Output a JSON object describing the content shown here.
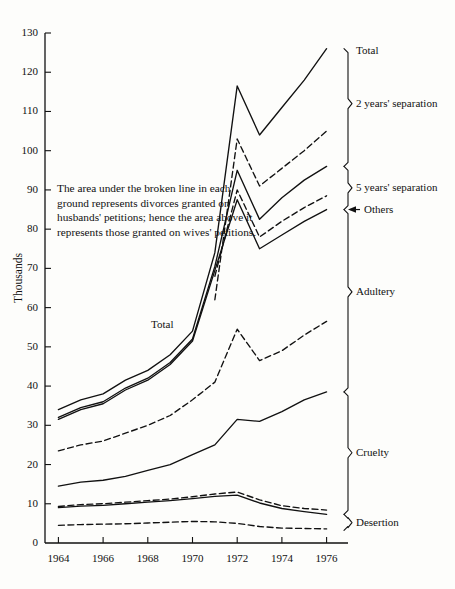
{
  "figure": {
    "y_axis_title": "Thousands",
    "annotation": "The area under the broken line in each ground represents divorces granted on husbands' petitions; hence the area above it represents those granted on wives' petitions.",
    "inner_total_label": "Total"
  },
  "chart_data": {
    "type": "area",
    "title": "",
    "xlabel": "",
    "ylabel": "Thousands",
    "xlim": [
      1963.4,
      1976.6
    ],
    "ylim": [
      0,
      130
    ],
    "yticks": [
      0,
      10,
      20,
      30,
      40,
      50,
      60,
      70,
      80,
      90,
      100,
      110,
      120,
      130
    ],
    "xticks": [
      1964,
      1966,
      1968,
      1970,
      1972,
      1974,
      1976
    ],
    "xtick_labels": [
      "1964",
      "1966",
      "1968",
      "1970",
      "1972",
      "1974",
      "1976"
    ],
    "grid": false,
    "legend_position": "right-brackets",
    "x": [
      1964,
      1965,
      1966,
      1967,
      1968,
      1969,
      1970,
      1971,
      1972,
      1973,
      1974,
      1975,
      1976
    ],
    "series": [
      {
        "name": "Total (all grounds, cumulative top)",
        "style": "solid",
        "bracket": "Total",
        "values": [
          34.0,
          36.5,
          38.0,
          41.5,
          44.0,
          48.0,
          54.0,
          74.0,
          116.5,
          104.0,
          111.0,
          118.0,
          126.0
        ]
      },
      {
        "name": "2 years' separation (husbands' petitions, broken)",
        "style": "dashed",
        "bracket": "2 years' separation",
        "values": [
          null,
          null,
          null,
          null,
          null,
          null,
          null,
          62.0,
          103.0,
          91.0,
          95.5,
          100.0,
          105.0
        ]
      },
      {
        "name": "2 years' separation lower bound",
        "style": "solid",
        "bracket": "",
        "values": [
          32.0,
          34.5,
          36.0,
          39.5,
          42.0,
          46.0,
          52.0,
          70.5,
          95.0,
          82.5,
          88.0,
          92.5,
          96.0
        ]
      },
      {
        "name": "5 years' separation (husbands' petitions, broken)",
        "style": "dashed",
        "bracket": "5 years' separation",
        "values": [
          null,
          null,
          null,
          null,
          null,
          null,
          null,
          68.0,
          90.0,
          78.0,
          82.0,
          85.5,
          88.5
        ]
      },
      {
        "name": "Others",
        "style": "solid",
        "bracket": "Others",
        "values": [
          31.5,
          34.0,
          35.5,
          39.0,
          41.5,
          45.5,
          51.5,
          69.5,
          87.5,
          75.0,
          78.5,
          82.0,
          85.0
        ]
      },
      {
        "name": "Adultery (broken, husbands' petitions)",
        "style": "dashed",
        "bracket": "Adultery",
        "values": [
          23.5,
          25.0,
          26.0,
          28.0,
          30.0,
          32.5,
          36.5,
          41.0,
          54.5,
          46.5,
          49.0,
          53.0,
          56.5
        ]
      },
      {
        "name": "Adultery lower bound",
        "style": "solid",
        "bracket": "",
        "values": [
          14.5,
          15.5,
          16.0,
          17.0,
          18.5,
          20.0,
          22.5,
          25.0,
          31.5,
          31.0,
          33.5,
          36.5,
          38.5
        ]
      },
      {
        "name": "Cruelty (broken, husbands' petitions)",
        "style": "dashed",
        "bracket": "Cruelty",
        "values": [
          9.3,
          9.8,
          10.0,
          10.4,
          10.8,
          11.2,
          11.8,
          12.5,
          13.0,
          11.0,
          9.5,
          8.8,
          8.4
        ]
      },
      {
        "name": "Cruelty lower bound",
        "style": "solid",
        "bracket": "",
        "values": [
          9.0,
          9.4,
          9.6,
          10.0,
          10.4,
          10.8,
          11.3,
          11.9,
          12.2,
          10.2,
          8.8,
          8.0,
          7.3
        ]
      },
      {
        "name": "Desertion (broken, husbands' petitions)",
        "style": "dashed",
        "bracket": "Desertion",
        "values": [
          4.5,
          4.7,
          4.8,
          4.9,
          5.1,
          5.3,
          5.5,
          5.4,
          5.0,
          4.2,
          3.8,
          3.7,
          3.6
        ]
      }
    ],
    "bracket_labels": [
      {
        "label": "Total",
        "y_value": 126
      },
      {
        "label": "2 years' separation",
        "y_value": 107
      },
      {
        "label": "5 years' separation",
        "y_value": 93
      },
      {
        "label": "Others",
        "y_value": 85
      },
      {
        "label": "Adultery",
        "y_value": 67
      },
      {
        "label": "Cruelty",
        "y_value": 25
      },
      {
        "label": "Desertion",
        "y_value": 5
      }
    ]
  }
}
